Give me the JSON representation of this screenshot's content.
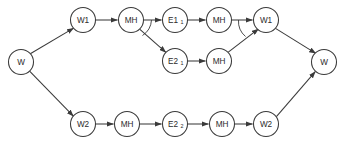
{
  "diagram": {
    "colors": {
      "stroke": "#3a3a3a",
      "node_fill": "#ffffff",
      "background": "#ffffff",
      "label": "#2b2b2b"
    },
    "nodes": [
      {
        "id": "w_start",
        "label": "W",
        "sub": "",
        "cx": 21,
        "cy": 62,
        "r": 12.5
      },
      {
        "id": "w1_top",
        "label": "W1",
        "sub": "",
        "cx": 83,
        "cy": 20,
        "r": 12.5
      },
      {
        "id": "mh_t1",
        "label": "MH",
        "sub": "",
        "cx": 131,
        "cy": 20,
        "r": 12.5
      },
      {
        "id": "e1_1",
        "label": "E1",
        "sub": "1",
        "cx": 175,
        "cy": 20,
        "r": 12.5
      },
      {
        "id": "mh_t2",
        "label": "MH",
        "sub": "",
        "cx": 219,
        "cy": 20,
        "r": 12.5
      },
      {
        "id": "w1_right",
        "label": "W1",
        "sub": "",
        "cx": 266,
        "cy": 20,
        "r": 12.5
      },
      {
        "id": "e2_1",
        "label": "E2",
        "sub": "1",
        "cx": 175,
        "cy": 61,
        "r": 12.5
      },
      {
        "id": "mh_m1",
        "label": "MH",
        "sub": "",
        "cx": 219,
        "cy": 61,
        "r": 12.5
      },
      {
        "id": "w_end",
        "label": "W",
        "sub": "",
        "cx": 324,
        "cy": 62,
        "r": 12.5
      },
      {
        "id": "w2_left",
        "label": "W2",
        "sub": "",
        "cx": 83,
        "cy": 124,
        "r": 12.5
      },
      {
        "id": "mh_b1",
        "label": "MH",
        "sub": "",
        "cx": 127,
        "cy": 124,
        "r": 12.5
      },
      {
        "id": "e2_2",
        "label": "E2",
        "sub": "2",
        "cx": 175,
        "cy": 124,
        "r": 12.5
      },
      {
        "id": "mh_b2",
        "label": "MH",
        "sub": "",
        "cx": 222,
        "cy": 124,
        "r": 12.5
      },
      {
        "id": "w2_right",
        "label": "W2",
        "sub": "",
        "cx": 266,
        "cy": 124,
        "r": 12.5
      }
    ],
    "edges": [
      {
        "id": "e-start-w1top",
        "from": "w_start",
        "to": "w1_top"
      },
      {
        "id": "e-w1top-mht1",
        "from": "w1_top",
        "to": "mh_t1"
      },
      {
        "id": "e-mht1-e11",
        "from": "mh_t1",
        "to": "e1_1"
      },
      {
        "id": "e-e11-mht2",
        "from": "e1_1",
        "to": "mh_t2"
      },
      {
        "id": "e-mht2-w1right",
        "from": "mh_t2",
        "to": "w1_right"
      },
      {
        "id": "e-mht1-e21",
        "from": "mh_t1",
        "to": "e2_1"
      },
      {
        "id": "e-e21-mhm1",
        "from": "e2_1",
        "to": "mh_m1"
      },
      {
        "id": "e-mhm1-w1right",
        "from": "mh_m1",
        "to": "w1_right"
      },
      {
        "id": "e-w1right-wend",
        "from": "w1_right",
        "to": "w_end"
      },
      {
        "id": "e-start-w2left",
        "from": "w_start",
        "to": "w2_left"
      },
      {
        "id": "e-w2left-mhb1",
        "from": "w2_left",
        "to": "mh_b1"
      },
      {
        "id": "e-mhb1-e22",
        "from": "mh_b1",
        "to": "e2_2"
      },
      {
        "id": "e-e22-mhb2",
        "from": "e2_2",
        "to": "mh_b2"
      },
      {
        "id": "e-mhb2-w2right",
        "from": "mh_b2",
        "to": "w2_right"
      },
      {
        "id": "e-w2right-wend",
        "from": "w2_right",
        "to": "w_end"
      }
    ],
    "branch_markers": [
      {
        "id": "fork-arc-mht1",
        "kind": "fork-arc"
      },
      {
        "id": "join-arc-w1right",
        "kind": "join-arc"
      }
    ]
  }
}
